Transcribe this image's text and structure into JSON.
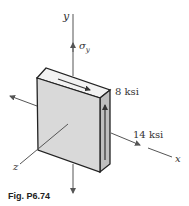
{
  "figure": {
    "caption": "Fig. P6.74",
    "axes": {
      "x": "x",
      "y": "y",
      "z": "z"
    },
    "labels": {
      "sigma_y": "σ",
      "sigma_y_sub": "y",
      "shear_stress": "8 ksi",
      "normal_stress_x": "14 ksi"
    },
    "colors": {
      "face_front": "#d9d9d9",
      "face_top": "#f2f2f2",
      "face_side": "#bfbfbf",
      "edge": "#222222",
      "axis": "#555555"
    }
  }
}
